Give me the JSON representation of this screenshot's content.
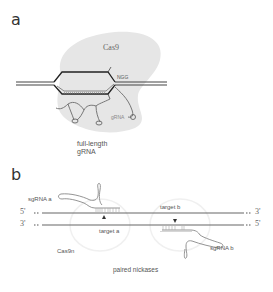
{
  "panel_a": {
    "label": "a",
    "protein": "Cas9",
    "pam": "NGG",
    "rna_label": "gRNA",
    "caption_line1": "full-length",
    "caption_line2": "gRNA"
  },
  "panel_b": {
    "label": "b",
    "sgrna_a": "sgRNA a",
    "sgrna_b": "sgRNA b",
    "target_a": "target a",
    "target_b": "target b",
    "protein": "Cas9n",
    "top_left_end": "5'",
    "top_right_end": "3'",
    "bottom_left_end": "3'",
    "bottom_right_end": "5'",
    "caption": "paired nickases"
  },
  "colors": {
    "cas9_blob": "#e6e6e6",
    "dna_strand": "#555555",
    "rna": "#777777"
  }
}
